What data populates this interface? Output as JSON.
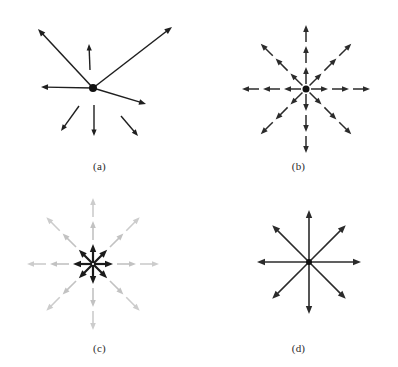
{
  "figure": {
    "background": "#ffffff",
    "width": 398,
    "height": 367,
    "colors": {
      "ink": "#1f1f1f",
      "ink_soft": "#2b2b2b",
      "gray_arrow": "#c9c9c9",
      "gray_arrow_mid": "#bdbdbd",
      "center_dot": "#111111"
    }
  },
  "panels": [
    {
      "id": "a",
      "label": "(a)",
      "description": "Irregular arrow set with solid center dot",
      "center": {
        "x": 93,
        "y": 88
      },
      "dot_radius": 4,
      "arrows": [
        {
          "name": "arrow-up-left-long",
          "x1": 93,
          "y1": 88,
          "x2": 38,
          "y2": 29,
          "color": "#1f1f1f",
          "width": 1.5,
          "head": 7.5,
          "attached": true
        },
        {
          "name": "arrow-up-right-long",
          "x1": 93,
          "y1": 88,
          "x2": 172,
          "y2": 27,
          "color": "#1f1f1f",
          "width": 1.5,
          "head": 7.5,
          "attached": true
        },
        {
          "name": "arrow-up-short",
          "x1": 90,
          "y1": 70,
          "x2": 89,
          "y2": 44,
          "color": "#1f1f1f",
          "width": 1.4,
          "head": 6.5,
          "attached": false
        },
        {
          "name": "arrow-left-medium",
          "x1": 93,
          "y1": 88,
          "x2": 41,
          "y2": 87,
          "color": "#1f1f1f",
          "width": 1.4,
          "head": 7.0,
          "attached": true
        },
        {
          "name": "arrow-down-right-medium",
          "x1": 93,
          "y1": 88,
          "x2": 146,
          "y2": 104,
          "color": "#1f1f1f",
          "width": 1.4,
          "head": 7.0,
          "attached": true
        },
        {
          "name": "arrow-down-left-short",
          "x1": 79,
          "y1": 106,
          "x2": 61,
          "y2": 131,
          "color": "#1f1f1f",
          "width": 1.4,
          "head": 6.5,
          "attached": false
        },
        {
          "name": "arrow-down-short",
          "x1": 94,
          "y1": 105,
          "x2": 94,
          "y2": 136,
          "color": "#1f1f1f",
          "width": 1.4,
          "head": 6.5,
          "attached": false
        },
        {
          "name": "arrow-down-right-short",
          "x1": 121,
          "y1": 116,
          "x2": 138,
          "y2": 136,
          "color": "#1f1f1f",
          "width": 1.4,
          "head": 6.5,
          "attached": false
        }
      ]
    },
    {
      "id": "b",
      "label": "(b)",
      "description": "Eight rays at 45 degree spacing, each with three nested arrowheads",
      "center": {
        "x": 107,
        "y": 89
      },
      "dot_radius": 3.5,
      "ray_angles_deg": [
        0,
        45,
        90,
        135,
        180,
        225,
        270,
        315
      ],
      "ray_radii": [
        22,
        43,
        64
      ],
      "segment_gap": 4,
      "color": "#2b2b2b",
      "line_width": 1.5,
      "head_size": 7
    },
    {
      "id": "c",
      "label": "(c)",
      "description": "Eight rays; innermost arrows black, outer arrows light gray",
      "center": {
        "x": 93,
        "y": 80
      },
      "ray_angles_deg": [
        0,
        45,
        90,
        135,
        180,
        225,
        270,
        315
      ],
      "rings": [
        {
          "name": "inner-ring-black",
          "radius": 20,
          "color": "#1a1a1a",
          "line_width": 2.2,
          "head_size": 8
        },
        {
          "name": "middle-ring-gray",
          "radius": 43,
          "color": "#c2c2c2",
          "line_width": 1.6,
          "head_size": 7
        },
        {
          "name": "outer-ring-gray",
          "radius": 66,
          "color": "#cccccc",
          "line_width": 1.6,
          "head_size": 7
        }
      ],
      "segment_gap": 4
    },
    {
      "id": "d",
      "label": "(d)",
      "description": "Eight uniform single arrows radiating from center",
      "center": {
        "x": 110,
        "y": 78
      },
      "dot_radius": 3,
      "ray_angles_deg": [
        0,
        45,
        90,
        135,
        180,
        225,
        270,
        315
      ],
      "radius": 52,
      "color": "#2b2b2b",
      "line_width": 1.6,
      "head_size": 8
    }
  ]
}
